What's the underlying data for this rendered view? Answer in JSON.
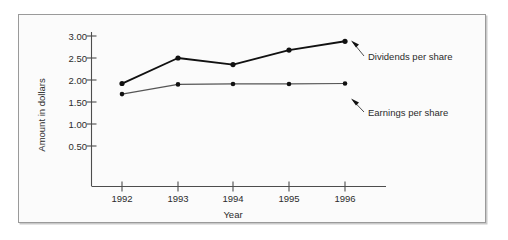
{
  "chart_data": {
    "type": "line",
    "title": "",
    "xlabel": "Year",
    "ylabel": "Amount in dollars",
    "categories": [
      "1992",
      "1993",
      "1994",
      "1995",
      "1996"
    ],
    "x": [
      1992,
      1993,
      1994,
      1995,
      1996
    ],
    "xlim": [
      1991.55,
      1996.75
    ],
    "ylim": [
      0,
      3.18
    ],
    "grid": false,
    "legend_position": "annotations-right",
    "y_ticks": [
      "0.50",
      "1.00",
      "1.50",
      "2.00",
      "2.50",
      "3.00"
    ],
    "y_tick_values": [
      0.5,
      1.0,
      1.5,
      2.0,
      2.5,
      3.0
    ],
    "x_ticks": [
      "1992",
      "1993",
      "1994",
      "1995",
      "1996"
    ],
    "series": [
      {
        "name": "Dividends per share",
        "values": [
          1.92,
          2.5,
          2.35,
          2.68,
          2.88
        ],
        "color": "#111111",
        "annotation": "Dividends per share"
      },
      {
        "name": "Earnings per share",
        "values": [
          1.68,
          1.9,
          1.91,
          1.91,
          1.92
        ],
        "color": "#555555",
        "annotation": "Earnings per share"
      }
    ],
    "annotations": [
      {
        "text": "Dividends per share",
        "target_series": "Dividends per share",
        "target_point": "1996"
      },
      {
        "text": "Earnings per share",
        "target_series": "Earnings per share",
        "target_point": "1996"
      }
    ]
  },
  "figure": {
    "y_axis_title": "Amount in dollars",
    "x_axis_title": "Year"
  }
}
